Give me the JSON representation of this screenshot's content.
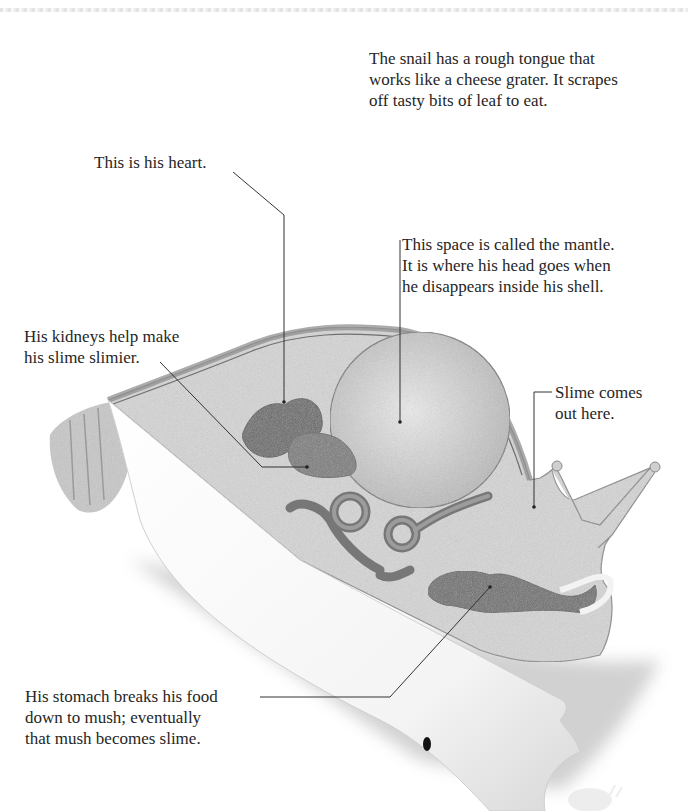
{
  "page": {
    "type": "illustrated book page"
  },
  "intro_text": "The snail has a rough tongue that\nworks like a cheese grater. It scrapes\noff tasty bits of leaf to eat.",
  "callouts": [
    {
      "id": "heart",
      "text": "This is his heart.",
      "target": "heart"
    },
    {
      "id": "mantle",
      "text": "This space is called the mantle.\nIt is where his head goes when\nhe disappears inside his shell.",
      "target": "mantle"
    },
    {
      "id": "kidneys",
      "text": "His kidneys help make\nhis slime slimier.",
      "target": "kidney"
    },
    {
      "id": "slime",
      "text": "Slime comes\nout here.",
      "target": "slime-opening"
    },
    {
      "id": "stomach",
      "text": "His stomach breaks his food\ndown to mush; eventually\nthat mush becomes slime.",
      "target": "stomach"
    }
  ],
  "colors": {
    "background": "#ffffff",
    "body_fill": "#d9d9d9",
    "organ_fill": "#6e6e6e",
    "kidney_fill": "#7a7a7a",
    "mantle_fill": "#cfcfcf",
    "shell_cut": "#ffffff",
    "leader_line": "#333333",
    "text": "#262626"
  }
}
